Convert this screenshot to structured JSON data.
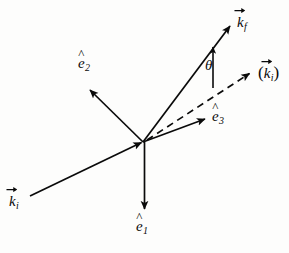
{
  "figure": {
    "name": "scattering-vector-diagram",
    "background_color": "#fdfdfc",
    "ink_color": "#0a0a0a",
    "width": 289,
    "height": 253
  },
  "origin": {
    "x": 143,
    "y": 142
  },
  "labels": {
    "k_final": {
      "base": "k",
      "sub": "f",
      "accent": "vector"
    },
    "k_initial": {
      "base": "k",
      "sub": "i",
      "accent": "vector"
    },
    "k_initial_primed_open": "(",
    "k_initial_primed_close": ")",
    "k_initial_primed": {
      "base": "k",
      "sub": "i",
      "accent": "vector"
    },
    "e_one": {
      "hat": "^",
      "base": "e",
      "sub": "1"
    },
    "e_two": {
      "hat": "^",
      "base": "e",
      "sub": "2"
    },
    "e_three": {
      "hat": "^",
      "base": "e",
      "sub": "3"
    },
    "theta": "θ"
  },
  "vectors": [
    {
      "name": "k-final-arrow",
      "label": "k_f",
      "style": "solid",
      "from": {
        "x": 143,
        "y": 142
      },
      "to": {
        "x": 232,
        "y": 24
      },
      "arrowhead": "at-tip"
    },
    {
      "name": "k-initial-arrow",
      "label": "k_i",
      "style": "solid",
      "from": {
        "x": 30,
        "y": 196
      },
      "to": {
        "x": 143,
        "y": 142
      },
      "arrowhead": "at-tip"
    },
    {
      "name": "k-initial-primed-arrow",
      "label": "(k_i)",
      "style": "dashed",
      "from": {
        "x": 143,
        "y": 142
      },
      "to": {
        "x": 252,
        "y": 72
      },
      "arrowhead": "at-tip"
    },
    {
      "name": "e1-basis-arrow",
      "label": "e1",
      "style": "solid",
      "from": {
        "x": 144,
        "y": 142
      },
      "to": {
        "x": 145,
        "y": 212
      },
      "arrowhead": "at-tip"
    },
    {
      "name": "e2-basis-arrow",
      "label": "e2",
      "style": "solid",
      "from": {
        "x": 143,
        "y": 142
      },
      "to": {
        "x": 88,
        "y": 88
      },
      "arrowhead": "at-tip"
    },
    {
      "name": "e3-basis-arrow",
      "label": "e3",
      "style": "solid",
      "from": {
        "x": 143,
        "y": 142
      },
      "to": {
        "x": 208,
        "y": 118
      },
      "arrowhead": "at-tip"
    },
    {
      "name": "theta-indicator-arrow",
      "label": "theta",
      "style": "solid",
      "from": {
        "x": 213,
        "y": 88
      },
      "to": {
        "x": 213,
        "y": 45
      },
      "arrowhead": "at-tip"
    }
  ]
}
